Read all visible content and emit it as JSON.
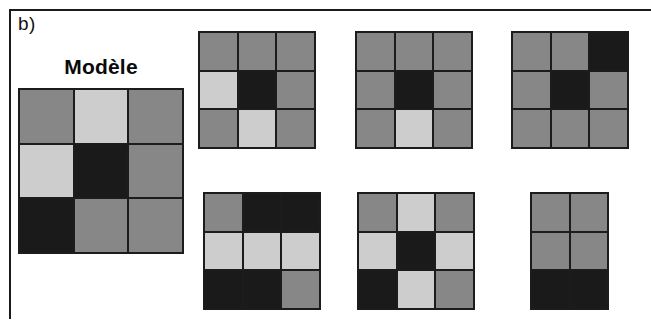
{
  "figure": {
    "panel_label": "b)",
    "model_title": "Modèle",
    "colors": {
      "mid_gray": "#878787",
      "light_gray": "#cdcdcd",
      "dark": "#1a1a1a",
      "grid_line": "#1c1c1c",
      "background": "#ffffff",
      "frame": "#1a1a1a"
    }
  },
  "model_grid": {
    "name": "Modèle",
    "rows": 3,
    "cols": 3,
    "cells": [
      [
        "gray",
        "light",
        "gray"
      ],
      [
        "light",
        "dark",
        "gray"
      ],
      [
        "dark",
        "gray",
        "gray"
      ]
    ]
  },
  "option_grids": [
    {
      "index": 1,
      "rows": 3,
      "cols": 3,
      "cells": [
        [
          "gray",
          "gray",
          "gray"
        ],
        [
          "light",
          "dark",
          "gray"
        ],
        [
          "gray",
          "light",
          "gray"
        ]
      ]
    },
    {
      "index": 2,
      "rows": 3,
      "cols": 3,
      "cells": [
        [
          "gray",
          "gray",
          "gray"
        ],
        [
          "gray",
          "dark",
          "gray"
        ],
        [
          "gray",
          "light",
          "gray"
        ]
      ]
    },
    {
      "index": 3,
      "rows": 3,
      "cols": 3,
      "cells": [
        [
          "gray",
          "gray",
          "dark"
        ],
        [
          "gray",
          "dark",
          "gray"
        ],
        [
          "gray",
          "gray",
          "gray"
        ]
      ]
    },
    {
      "index": 4,
      "rows": 3,
      "cols": 3,
      "cells": [
        [
          "gray",
          "dark",
          "dark"
        ],
        [
          "light",
          "light",
          "light"
        ],
        [
          "dark",
          "dark",
          "gray"
        ]
      ]
    },
    {
      "index": 5,
      "rows": 3,
      "cols": 3,
      "cells": [
        [
          "gray",
          "light",
          "gray"
        ],
        [
          "light",
          "dark",
          "light"
        ],
        [
          "dark",
          "light",
          "gray"
        ]
      ]
    },
    {
      "index": 6,
      "rows": 3,
      "cols": 2,
      "cells": [
        [
          "gray",
          "gray"
        ],
        [
          "gray",
          "gray"
        ],
        [
          "dark",
          "dark"
        ]
      ]
    }
  ]
}
